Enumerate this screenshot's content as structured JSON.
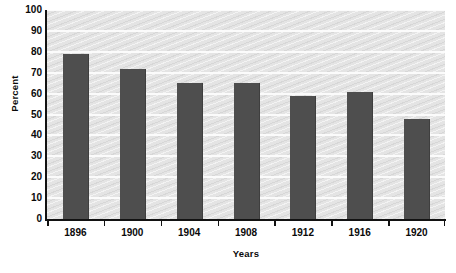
{
  "chart_data": {
    "type": "bar",
    "title": "",
    "subtitle": "",
    "xlabel": "Years",
    "ylabel": "Percent",
    "categories": [
      "1896",
      "1900",
      "1904",
      "1908",
      "1912",
      "1916",
      "1920"
    ],
    "values": [
      79,
      72,
      65,
      65,
      59,
      61,
      48
    ],
    "series": [
      {
        "name": "Percent",
        "values": [
          79,
          72,
          65,
          65,
          59,
          61,
          48
        ]
      }
    ],
    "ylim": [
      0,
      100
    ],
    "ytick_labels": [
      "100",
      "90",
      "80",
      "70",
      "60",
      "50",
      "40",
      "30",
      "20",
      "10",
      "0"
    ],
    "ytick_values": [
      100,
      90,
      80,
      70,
      60,
      50,
      40,
      30,
      20,
      10,
      0
    ],
    "ytick_step": 10,
    "grid": true,
    "grid_orientation": "horizontal",
    "grid_color": "#fbfbfb",
    "legend": false,
    "legend_position": "none",
    "bar_color": "#4e4e4e",
    "plot_background_color": "#e4e4e4",
    "axis_color": "#121212",
    "annotations": []
  }
}
